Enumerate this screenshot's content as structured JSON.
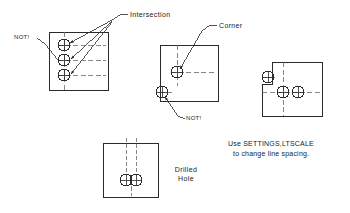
{
  "drawing": {
    "title_present": false,
    "colors": {
      "line": "#2b2b2b",
      "hidden_line": "#555555",
      "background": "#ffffff",
      "text": "#222222"
    }
  },
  "labels": {
    "intersection": "Intersection",
    "corner": "Corner",
    "not_left": "NOT!",
    "not_middle": "NOT!",
    "drilled": "Drilled",
    "hole": "Hole"
  },
  "hint": {
    "line1": "Use SETTINGS,LTSCALE",
    "line2": "to change line spacing."
  },
  "panels": [
    {
      "id": "panel-intersection",
      "name": "three-holes-on-edge",
      "rect": {
        "x": 49,
        "y": 32,
        "w": 59,
        "h": 58
      },
      "holes": [
        {
          "cx": 64,
          "cy": 45,
          "r": 6
        },
        {
          "cx": 64,
          "cy": 60,
          "r": 6
        },
        {
          "cx": 64,
          "cy": 75,
          "r": 6
        }
      ]
    },
    {
      "id": "panel-corner",
      "name": "corner-and-edge-hole",
      "rect": {
        "x": 160,
        "y": 45,
        "w": 58,
        "h": 56
      },
      "holes": [
        {
          "cx": 177,
          "cy": 72,
          "r": 6
        },
        {
          "cx": 162,
          "cy": 92,
          "r": 6
        }
      ]
    },
    {
      "id": "panel-notched",
      "name": "notched-plate-two-holes",
      "rect": {
        "x": 272,
        "y": 62,
        "w": 50,
        "h": 54
      },
      "holes": [
        {
          "cx": 268,
          "cy": 77,
          "r": 6
        },
        {
          "cx": 283,
          "cy": 92,
          "r": 6
        },
        {
          "cx": 298,
          "cy": 92,
          "r": 6
        }
      ]
    },
    {
      "id": "panel-drilled-hole",
      "name": "drilled-hole-section",
      "rect": {
        "x": 103,
        "y": 143,
        "w": 55,
        "h": 54
      },
      "holes": [
        {
          "cx": 126,
          "cy": 180,
          "r": 6
        },
        {
          "cx": 136,
          "cy": 180,
          "r": 6
        }
      ]
    }
  ],
  "icons": {
    "leader_arrow": "arrow-head",
    "centerline": "dash-dot-line",
    "hidden": "dashed-line"
  }
}
